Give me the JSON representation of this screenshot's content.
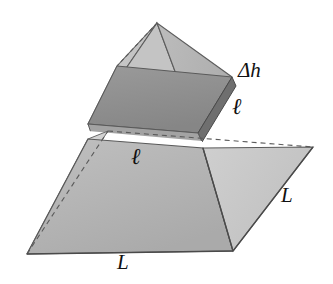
{
  "figure": {
    "background_color": "#ffffff",
    "width": 333,
    "height": 284
  },
  "labels": {
    "delta_h": "Δh",
    "ell_right": "ℓ",
    "ell_front": "ℓ",
    "L_right": "L",
    "L_bottom": "L"
  },
  "geometry": {
    "apex": [
      157,
      23
    ],
    "base_left": [
      27,
      254
    ],
    "base_front": [
      233,
      251
    ],
    "base_right": [
      313,
      147
    ],
    "base_back": [
      108,
      131
    ],
    "slab_top_back": [
      117,
      66
    ],
    "slab_top_left": [
      88,
      124
    ],
    "slab_top_front": [
      198,
      133
    ],
    "slab_top_right": [
      232,
      77
    ],
    "slab_thickness_px": 9,
    "gap_px": 7
  },
  "colors": {
    "outline": "#4a4a4a",
    "front_left_face": "#b4b4b4",
    "front_right_face": "#c9c9c9",
    "upper_left_face": "#c6c6c6",
    "upper_right_face": "#b9b9b9",
    "slab_top": "#8e8e8e",
    "slab_side": "#6f6f6f",
    "slab_front_side": "#a0a0a0",
    "hidden_edge": "#5a5a5a",
    "label_color": "#111111"
  }
}
